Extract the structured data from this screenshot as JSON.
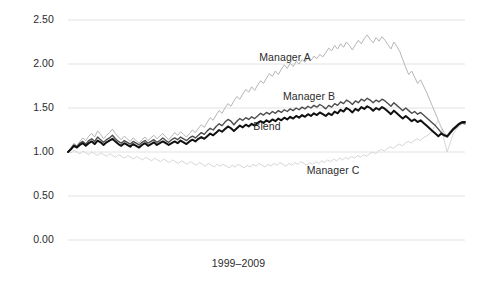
{
  "chart_data": {
    "type": "line",
    "title": "",
    "subtitle": "",
    "xlabel": "1999–2009",
    "ylabel": "",
    "ylim": [
      0.0,
      2.5
    ],
    "xlim": [
      0,
      132
    ],
    "grid": true,
    "legend_position": "inline-annotations",
    "yticks": [
      "0.00",
      "0.50",
      "1.00",
      "1.50",
      "2.00",
      "2.50"
    ],
    "ytick_values": [
      0.0,
      0.5,
      1.0,
      1.5,
      2.0,
      2.5
    ],
    "xticks": [],
    "x_note": "Monthly index values over the period 1999–2009; all series rebased to 1.00 at start.",
    "annotations": [
      {
        "text": "Manager A",
        "x_index": 74,
        "y_value": 2.07
      },
      {
        "text": "Manager B",
        "x_index": 82,
        "y_value": 1.62
      },
      {
        "text": "Blend",
        "x_index": 72,
        "y_value": 1.28
      },
      {
        "text": "Manager C",
        "x_index": 90,
        "y_value": 0.78
      }
    ],
    "series": [
      {
        "name": "Manager A",
        "color": "#b5b5b5",
        "width": 1.0,
        "values": [
          1.0,
          1.05,
          1.1,
          1.07,
          1.12,
          1.16,
          1.13,
          1.18,
          1.21,
          1.17,
          1.24,
          1.2,
          1.15,
          1.19,
          1.22,
          1.26,
          1.21,
          1.17,
          1.14,
          1.18,
          1.15,
          1.12,
          1.16,
          1.13,
          1.1,
          1.14,
          1.17,
          1.13,
          1.16,
          1.19,
          1.15,
          1.18,
          1.21,
          1.17,
          1.14,
          1.18,
          1.22,
          1.19,
          1.23,
          1.2,
          1.17,
          1.21,
          1.25,
          1.22,
          1.27,
          1.31,
          1.28,
          1.34,
          1.39,
          1.36,
          1.42,
          1.47,
          1.44,
          1.5,
          1.55,
          1.52,
          1.58,
          1.63,
          1.6,
          1.66,
          1.71,
          1.68,
          1.74,
          1.7,
          1.76,
          1.81,
          1.78,
          1.84,
          1.89,
          1.86,
          1.92,
          1.88,
          1.94,
          1.99,
          1.95,
          2.01,
          1.97,
          2.03,
          2.0,
          2.05,
          2.02,
          2.07,
          2.04,
          2.09,
          2.06,
          2.11,
          2.08,
          2.13,
          2.18,
          2.15,
          2.21,
          2.17,
          2.23,
          2.19,
          2.25,
          2.21,
          2.16,
          2.22,
          2.27,
          2.23,
          2.29,
          2.33,
          2.28,
          2.24,
          2.3,
          2.26,
          2.31,
          2.27,
          2.22,
          2.17,
          2.25,
          2.2,
          2.14,
          2.05,
          1.96,
          1.88,
          1.92,
          1.85,
          1.78,
          1.82,
          1.75,
          1.68,
          1.6,
          1.52,
          1.44,
          1.36,
          1.28,
          1.22,
          1.18,
          1.24,
          1.27,
          1.3,
          1.33,
          1.34,
          1.33
        ]
      },
      {
        "name": "Manager C",
        "color": "#d6d6d6",
        "width": 1.0,
        "values": [
          1.0,
          0.99,
          1.02,
          1.0,
          0.98,
          1.01,
          0.99,
          0.97,
          1.0,
          0.98,
          0.96,
          0.99,
          0.97,
          0.95,
          0.98,
          0.96,
          0.94,
          0.97,
          0.95,
          0.93,
          0.96,
          0.94,
          0.92,
          0.95,
          0.93,
          0.91,
          0.94,
          0.92,
          0.9,
          0.93,
          0.91,
          0.89,
          0.92,
          0.9,
          0.88,
          0.91,
          0.89,
          0.87,
          0.9,
          0.88,
          0.86,
          0.89,
          0.87,
          0.85,
          0.88,
          0.86,
          0.84,
          0.87,
          0.85,
          0.83,
          0.86,
          0.84,
          0.86,
          0.84,
          0.82,
          0.85,
          0.83,
          0.86,
          0.84,
          0.82,
          0.85,
          0.83,
          0.86,
          0.84,
          0.87,
          0.85,
          0.83,
          0.86,
          0.84,
          0.87,
          0.85,
          0.88,
          0.86,
          0.84,
          0.87,
          0.85,
          0.88,
          0.86,
          0.89,
          0.87,
          0.85,
          0.88,
          0.86,
          0.89,
          0.87,
          0.9,
          0.88,
          0.91,
          0.89,
          0.92,
          0.9,
          0.93,
          0.91,
          0.94,
          0.92,
          0.95,
          0.93,
          0.96,
          0.94,
          0.97,
          0.95,
          0.98,
          1.0,
          0.98,
          1.01,
          1.03,
          1.01,
          1.04,
          1.06,
          1.04,
          1.07,
          1.09,
          1.07,
          1.1,
          1.12,
          1.1,
          1.13,
          1.15,
          1.13,
          1.16,
          1.18,
          1.2,
          1.24,
          1.3,
          1.36,
          1.28,
          1.14,
          1.0,
          1.1,
          1.2,
          1.26,
          1.29,
          1.32,
          1.33
        ]
      },
      {
        "name": "Manager B",
        "color": "#4d4d4d",
        "width": 1.4,
        "values": [
          1.0,
          1.04,
          1.08,
          1.06,
          1.1,
          1.12,
          1.09,
          1.13,
          1.15,
          1.12,
          1.17,
          1.14,
          1.11,
          1.14,
          1.16,
          1.19,
          1.15,
          1.12,
          1.1,
          1.13,
          1.11,
          1.09,
          1.12,
          1.1,
          1.08,
          1.11,
          1.13,
          1.1,
          1.12,
          1.14,
          1.11,
          1.13,
          1.16,
          1.13,
          1.11,
          1.14,
          1.16,
          1.14,
          1.17,
          1.15,
          1.13,
          1.16,
          1.18,
          1.16,
          1.19,
          1.22,
          1.2,
          1.24,
          1.27,
          1.25,
          1.29,
          1.32,
          1.3,
          1.34,
          1.37,
          1.35,
          1.31,
          1.35,
          1.38,
          1.36,
          1.39,
          1.37,
          1.4,
          1.38,
          1.41,
          1.44,
          1.42,
          1.45,
          1.43,
          1.46,
          1.44,
          1.47,
          1.45,
          1.48,
          1.46,
          1.49,
          1.47,
          1.5,
          1.48,
          1.51,
          1.49,
          1.52,
          1.5,
          1.53,
          1.51,
          1.54,
          1.52,
          1.49,
          1.53,
          1.51,
          1.55,
          1.53,
          1.57,
          1.55,
          1.59,
          1.57,
          1.54,
          1.58,
          1.56,
          1.6,
          1.58,
          1.61,
          1.59,
          1.56,
          1.59,
          1.57,
          1.6,
          1.58,
          1.55,
          1.52,
          1.56,
          1.53,
          1.5,
          1.47,
          1.5,
          1.47,
          1.44,
          1.46,
          1.43,
          1.45,
          1.42,
          1.39,
          1.36,
          1.33,
          1.3,
          1.26,
          1.22,
          1.19,
          1.17,
          1.21,
          1.25,
          1.28,
          1.31,
          1.33,
          1.32
        ]
      },
      {
        "name": "Blend",
        "color": "#111111",
        "width": 2.0,
        "values": [
          1.0,
          1.03,
          1.07,
          1.05,
          1.08,
          1.1,
          1.07,
          1.1,
          1.12,
          1.09,
          1.13,
          1.11,
          1.08,
          1.11,
          1.13,
          1.15,
          1.12,
          1.09,
          1.07,
          1.1,
          1.08,
          1.06,
          1.09,
          1.07,
          1.05,
          1.08,
          1.1,
          1.07,
          1.09,
          1.11,
          1.08,
          1.1,
          1.12,
          1.1,
          1.08,
          1.1,
          1.12,
          1.1,
          1.13,
          1.11,
          1.09,
          1.12,
          1.14,
          1.12,
          1.15,
          1.17,
          1.15,
          1.18,
          1.21,
          1.19,
          1.22,
          1.25,
          1.23,
          1.26,
          1.29,
          1.27,
          1.24,
          1.27,
          1.3,
          1.28,
          1.31,
          1.29,
          1.32,
          1.3,
          1.33,
          1.35,
          1.33,
          1.36,
          1.34,
          1.37,
          1.35,
          1.38,
          1.36,
          1.39,
          1.37,
          1.4,
          1.38,
          1.41,
          1.39,
          1.42,
          1.4,
          1.43,
          1.41,
          1.44,
          1.42,
          1.45,
          1.43,
          1.41,
          1.44,
          1.42,
          1.46,
          1.44,
          1.48,
          1.46,
          1.5,
          1.48,
          1.45,
          1.49,
          1.47,
          1.51,
          1.49,
          1.52,
          1.5,
          1.47,
          1.5,
          1.48,
          1.51,
          1.49,
          1.46,
          1.43,
          1.47,
          1.44,
          1.41,
          1.38,
          1.41,
          1.38,
          1.35,
          1.37,
          1.34,
          1.36,
          1.33,
          1.3,
          1.27,
          1.24,
          1.21,
          1.18,
          1.21,
          1.19,
          1.18,
          1.22,
          1.26,
          1.29,
          1.32,
          1.34,
          1.34
        ]
      }
    ]
  }
}
